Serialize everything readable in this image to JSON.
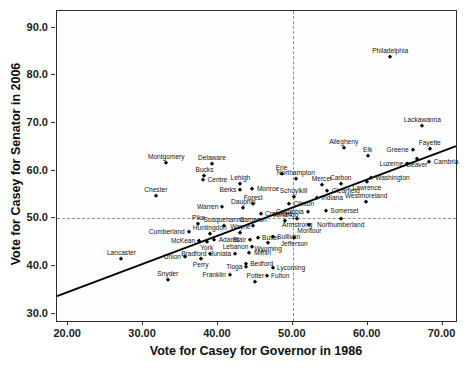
{
  "chart_data": {
    "type": "scatter",
    "xlabel": "Vote for Casey for Governor in 1986",
    "ylabel": "Vote for Casey for Senator in 2006",
    "xlim": [
      18.5,
      71.8
    ],
    "ylim": [
      28.5,
      93.5
    ],
    "x_ticks": [
      20,
      30,
      40,
      50,
      60,
      70
    ],
    "x_tick_labels": [
      "20.00",
      "30.00",
      "40.00",
      "50.00",
      "60.00",
      "70.00"
    ],
    "y_ticks": [
      30,
      40,
      50,
      60,
      70,
      80,
      90
    ],
    "y_tick_labels": [
      "30.0",
      "40.0",
      "50.0",
      "60.0",
      "70.0",
      "80.0",
      "90.0"
    ],
    "grid": false,
    "legend": "none",
    "marker": {
      "shape": "diamond",
      "color": "#000000",
      "size": 4
    },
    "reference_lines": [
      {
        "axis": "x",
        "value": 50,
        "style": "dashed"
      },
      {
        "axis": "y",
        "value": 50,
        "style": "dashed"
      }
    ],
    "fit_line": {
      "type": "linear",
      "intercept": 22.8,
      "slope": 0.59,
      "x_start": 18.5,
      "x_end": 71.8
    },
    "points": [
      {
        "label": "Philadelphia",
        "x": 63.0,
        "y": 83.8,
        "label_pos": "above"
      },
      {
        "label": "Lackawanna",
        "x": 67.3,
        "y": 69.4,
        "label_pos": "above"
      },
      {
        "label": "Fayette",
        "x": 68.3,
        "y": 64.6,
        "label_pos": "above"
      },
      {
        "label": "Greene",
        "x": 66.0,
        "y": 64.4,
        "label_pos": "left"
      },
      {
        "label": "Cambria",
        "x": 68.2,
        "y": 61.8,
        "label_pos": "right"
      },
      {
        "label": "Beaver",
        "x": 66.6,
        "y": 62.4,
        "label_pos": "below"
      },
      {
        "label": "Luzerne",
        "x": 65.3,
        "y": 61.5,
        "label_pos": "left"
      },
      {
        "label": "Elk",
        "x": 60.0,
        "y": 63.0,
        "label_pos": "above"
      },
      {
        "label": "Allegheny",
        "x": 56.8,
        "y": 64.8,
        "label_pos": "above"
      },
      {
        "label": "Washington",
        "x": 60.4,
        "y": 58.5,
        "label_pos": "right"
      },
      {
        "label": "Lawrence",
        "x": 59.9,
        "y": 57.6,
        "label_pos": "below"
      },
      {
        "label": "Westmoreland",
        "x": 59.8,
        "y": 53.4,
        "label_pos": "above"
      },
      {
        "label": "Carbon",
        "x": 56.4,
        "y": 57.3,
        "label_pos": "above"
      },
      {
        "label": "Mercer",
        "x": 53.9,
        "y": 57.0,
        "label_pos": "above"
      },
      {
        "label": "Clearfield",
        "x": 54.6,
        "y": 55.8,
        "label_pos": "right"
      },
      {
        "label": "Indiana",
        "x": 53.2,
        "y": 54.2,
        "label_pos": "right"
      },
      {
        "label": "Schuylkill",
        "x": 50.1,
        "y": 54.5,
        "label_pos": "above"
      },
      {
        "label": "Northampton",
        "x": 50.4,
        "y": 58.3,
        "label_pos": "above"
      },
      {
        "label": "Erie",
        "x": 48.5,
        "y": 59.4,
        "label_pos": "above"
      },
      {
        "label": "Montgomery",
        "x": 33.1,
        "y": 61.7,
        "label_pos": "above"
      },
      {
        "label": "Delaware",
        "x": 39.2,
        "y": 61.5,
        "label_pos": "above"
      },
      {
        "label": "Bucks",
        "x": 38.2,
        "y": 58.9,
        "label_pos": "above"
      },
      {
        "label": "Centre",
        "x": 38.0,
        "y": 58.0,
        "label_pos": "right"
      },
      {
        "label": "Chester",
        "x": 31.7,
        "y": 54.8,
        "label_pos": "above"
      },
      {
        "label": "Lehigh",
        "x": 43.0,
        "y": 57.3,
        "label_pos": "above"
      },
      {
        "label": "Monroe",
        "x": 44.6,
        "y": 56.2,
        "label_pos": "right"
      },
      {
        "label": "Berks",
        "x": 43.0,
        "y": 55.9,
        "label_pos": "left"
      },
      {
        "label": "Forest",
        "x": 44.7,
        "y": 53.0,
        "label_pos": "above"
      },
      {
        "label": "Warren",
        "x": 40.6,
        "y": 52.3,
        "label_pos": "left"
      },
      {
        "label": "Dauphin",
        "x": 43.4,
        "y": 52.1,
        "label_pos": "above"
      },
      {
        "label": "Crawford",
        "x": 45.7,
        "y": 51.0,
        "label_pos": "right"
      },
      {
        "label": "Columbia",
        "x": 52.0,
        "y": 51.4,
        "label_pos": "left"
      },
      {
        "label": "Somerset",
        "x": 54.4,
        "y": 51.5,
        "label_pos": "right"
      },
      {
        "label": "Clinton",
        "x": 49.5,
        "y": 53.1,
        "label_pos": "right"
      },
      {
        "label": "Venango",
        "x": 49.0,
        "y": 49.4,
        "label_pos": "above"
      },
      {
        "label": "Cameron",
        "x": 44.7,
        "y": 48.5,
        "label_pos": "above"
      },
      {
        "label": "Susquehanna",
        "x": 40.8,
        "y": 48.5,
        "label_pos": "above"
      },
      {
        "label": "Pike",
        "x": 37.4,
        "y": 48.8,
        "label_pos": "above"
      },
      {
        "label": "Armstrong",
        "x": 50.6,
        "y": 49.8,
        "label_pos": "below"
      },
      {
        "label": "Montour",
        "x": 52.2,
        "y": 48.6,
        "label_pos": "below"
      },
      {
        "label": "Northumberland",
        "x": 56.4,
        "y": 49.8,
        "label_pos": "below"
      },
      {
        "label": "Huntingdon",
        "x": 38.9,
        "y": 46.8,
        "label_pos": "above"
      },
      {
        "label": "Wayne",
        "x": 43.0,
        "y": 46.9,
        "label_pos": "above"
      },
      {
        "label": "Adams",
        "x": 39.5,
        "y": 45.5,
        "label_pos": "right"
      },
      {
        "label": "York",
        "x": 38.5,
        "y": 45.0,
        "label_pos": "below"
      },
      {
        "label": "McKean",
        "x": 37.5,
        "y": 45.2,
        "label_pos": "left"
      },
      {
        "label": "Blair",
        "x": 44.3,
        "y": 45.4,
        "label_pos": "left"
      },
      {
        "label": "Butler",
        "x": 45.3,
        "y": 46.0,
        "label_pos": "right"
      },
      {
        "label": "Sullivan",
        "x": 47.3,
        "y": 46.2,
        "label_pos": "right"
      },
      {
        "label": "Jefferson",
        "x": 50.2,
        "y": 45.9,
        "label_pos": "below"
      },
      {
        "label": "Lebanon",
        "x": 44.6,
        "y": 44.1,
        "label_pos": "left"
      },
      {
        "label": "Wyoming",
        "x": 46.7,
        "y": 44.9,
        "label_pos": "below"
      },
      {
        "label": "Mifflin",
        "x": 44.2,
        "y": 42.7,
        "label_pos": "right"
      },
      {
        "label": "Juniata",
        "x": 42.3,
        "y": 42.5,
        "label_pos": "left"
      },
      {
        "label": "Bedford",
        "x": 43.7,
        "y": 40.4,
        "label_pos": "right"
      },
      {
        "label": "Lycoming",
        "x": 47.3,
        "y": 39.7,
        "label_pos": "right"
      },
      {
        "label": "Fulton",
        "x": 46.5,
        "y": 37.9,
        "label_pos": "right"
      },
      {
        "label": "Tioga",
        "x": 43.8,
        "y": 39.9,
        "label_pos": "left"
      },
      {
        "label": "Potter",
        "x": 45.0,
        "y": 36.7,
        "label_pos": "above"
      },
      {
        "label": "Franklin",
        "x": 41.6,
        "y": 38.1,
        "label_pos": "left"
      },
      {
        "label": "Snyder",
        "x": 33.3,
        "y": 37.1,
        "label_pos": "above"
      },
      {
        "label": "Perry",
        "x": 37.7,
        "y": 41.6,
        "label_pos": "below"
      },
      {
        "label": "Bradford",
        "x": 39.0,
        "y": 42.5,
        "label_pos": "left"
      },
      {
        "label": "Union",
        "x": 35.6,
        "y": 42.0,
        "label_pos": "left"
      },
      {
        "label": "Cumberland",
        "x": 36.1,
        "y": 47.1,
        "label_pos": "left"
      },
      {
        "label": "Lancaster",
        "x": 27.1,
        "y": 41.5,
        "label_pos": "above"
      }
    ]
  },
  "colors": {
    "marker": "#000000",
    "fit_line": "#000000",
    "reference_line": "#8f8f8f",
    "axis": "#2e2e2e",
    "text": "#111111",
    "background": "#ffffff"
  }
}
